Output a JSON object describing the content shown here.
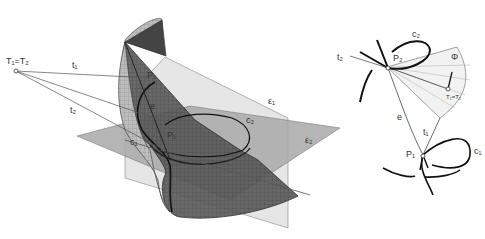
{
  "figure": {
    "left_diagram": {
      "description": "Ruled surface with two planes and tangent lines from a common point",
      "labels": {
        "apex": "T₁=T₂",
        "t1": "t₁",
        "t2": "t₂",
        "P1": "P₁",
        "e": "e",
        "P": "P₁",
        "c1": "c₁",
        "c2": "c₂",
        "eps1": "ε₁",
        "eps2": "ε₂"
      }
    },
    "right_diagram": {
      "description": "Two curves with tangent lines meeting at T1=T2 and a fan region Phi",
      "labels": {
        "t2": "t₂",
        "c2": "c₂",
        "P2": "P₂",
        "Phi": "Φ",
        "T": "T₁=T₂",
        "e": "e",
        "t1": "t₁",
        "P1": "P₁",
        "c1": "c₁"
      }
    }
  },
  "colors": {
    "surface_dark": "#4a4a4a",
    "surface_mid": "#7a7a7a",
    "plane_light": "#d8d8d8",
    "plane_mid": "#a6a6a6",
    "line": "#333333"
  }
}
